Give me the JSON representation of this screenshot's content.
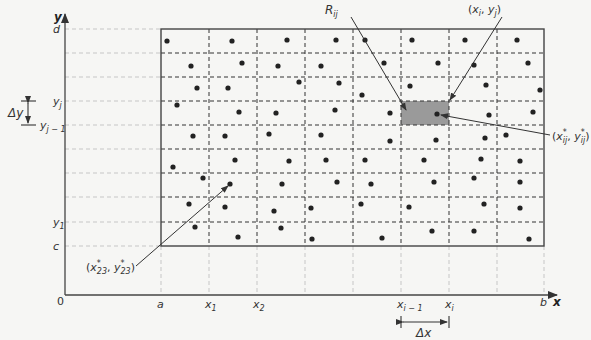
{
  "diagram": {
    "colors": {
      "background": "#f6f6f4",
      "axis": "#555555",
      "grid_dashed": "#333333",
      "guide_dashed": "#bbbbbb",
      "shaded_cell": "#9a9a9a",
      "dot": "#222222"
    },
    "axes": {
      "x_label": "x",
      "y_label": "y",
      "origin_label": "0"
    },
    "x_ticks": [
      {
        "base": "a",
        "sub": "",
        "px": 161
      },
      {
        "base": "x",
        "sub": "1",
        "px": 209
      },
      {
        "base": "x",
        "sub": "2",
        "px": 257
      },
      {
        "base": "x",
        "sub": "i − 1",
        "px": 401
      },
      {
        "base": "x",
        "sub": "i",
        "px": 449
      },
      {
        "base": "b",
        "sub": "",
        "px": 544
      }
    ],
    "y_ticks": [
      {
        "base": "d",
        "sub": "",
        "py": 29
      },
      {
        "base": "y",
        "sub": "j",
        "py": 101
      },
      {
        "base": "y",
        "sub": "j − 1",
        "py": 125
      },
      {
        "base": "y",
        "sub": "1",
        "py": 222
      },
      {
        "base": "c",
        "sub": "",
        "py": 246
      }
    ],
    "grid": {
      "x_lines": [
        161,
        209,
        257,
        305,
        353,
        401,
        449,
        497,
        544
      ],
      "y_lines": [
        29,
        53,
        77,
        101,
        125,
        149,
        173,
        197,
        222,
        246
      ],
      "columns": 8,
      "rows": 9
    },
    "shaded_cell": {
      "label_base": "R",
      "label_sub": "ij",
      "x": 401,
      "y": 101,
      "w": 48,
      "h": 24
    },
    "sample_points": [
      [
        167,
        41
      ],
      [
        191,
        66
      ],
      [
        197,
        88
      ],
      [
        177,
        105
      ],
      [
        193,
        136
      ],
      [
        173,
        167
      ],
      [
        203,
        178
      ],
      [
        189,
        204
      ],
      [
        195,
        227
      ],
      [
        232,
        41
      ],
      [
        242,
        63
      ],
      [
        228,
        88
      ],
      [
        239,
        112
      ],
      [
        225,
        136
      ],
      [
        235,
        160
      ],
      [
        230,
        184
      ],
      [
        225,
        207
      ],
      [
        238,
        237
      ],
      [
        287,
        40
      ],
      [
        278,
        66
      ],
      [
        299,
        82
      ],
      [
        276,
        113
      ],
      [
        269,
        134
      ],
      [
        289,
        161
      ],
      [
        282,
        184
      ],
      [
        274,
        211
      ],
      [
        281,
        228
      ],
      [
        336,
        40
      ],
      [
        321,
        66
      ],
      [
        339,
        83
      ],
      [
        335,
        110
      ],
      [
        321,
        135
      ],
      [
        326,
        160
      ],
      [
        337,
        182
      ],
      [
        311,
        208
      ],
      [
        312,
        239
      ],
      [
        365,
        40
      ],
      [
        384,
        63
      ],
      [
        362,
        95
      ],
      [
        390,
        113
      ],
      [
        390,
        141
      ],
      [
        365,
        160
      ],
      [
        371,
        184
      ],
      [
        361,
        204
      ],
      [
        382,
        238
      ],
      [
        412,
        40
      ],
      [
        438,
        63
      ],
      [
        410,
        86
      ],
      [
        437,
        114
      ],
      [
        436,
        140
      ],
      [
        424,
        160
      ],
      [
        434,
        182
      ],
      [
        409,
        207
      ],
      [
        432,
        231
      ],
      [
        465,
        40
      ],
      [
        474,
        65
      ],
      [
        486,
        85
      ],
      [
        489,
        115
      ],
      [
        485,
        138
      ],
      [
        481,
        159
      ],
      [
        474,
        178
      ],
      [
        484,
        204
      ],
      [
        474,
        231
      ],
      [
        517,
        40
      ],
      [
        528,
        63
      ],
      [
        540,
        90
      ],
      [
        533,
        112
      ],
      [
        506,
        135
      ],
      [
        520,
        161
      ],
      [
        520,
        182
      ],
      [
        520,
        208
      ],
      [
        529,
        239
      ]
    ],
    "annotations": {
      "R_ij": {
        "base": "R",
        "sub": "ij"
      },
      "corner_point": {
        "text_open": "(",
        "x": "x",
        "x_sub": "i",
        "sep": ", ",
        "y": "y",
        "y_sub": "j",
        "text_close": ")"
      },
      "sample_ij": {
        "text_open": "(",
        "x": "x",
        "x_sub": "ij",
        "star": "*",
        "sep": ", ",
        "y": "y",
        "y_sub": "ij",
        "text_close": ")"
      },
      "sample_23": {
        "text_open": "(",
        "x": "x",
        "x_sub": "23",
        "star": "*",
        "sep": ", ",
        "y": "y",
        "y_sub": "23",
        "text_close": ")"
      }
    },
    "delta_x_label": "Δx",
    "delta_y_label": "Δy"
  }
}
